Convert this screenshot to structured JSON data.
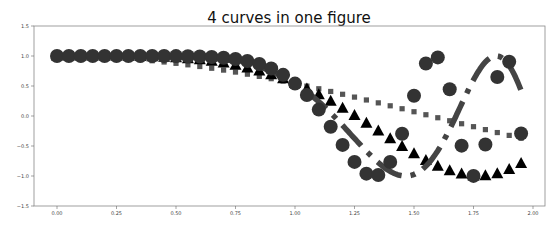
{
  "chart_data": {
    "type": "line",
    "title": "4 curves in one figure",
    "xlabel": "",
    "ylabel": "",
    "xlim": [
      -0.1,
      2.05
    ],
    "ylim": [
      -1.5,
      1.5
    ],
    "grid": false,
    "legend": null,
    "xticks": [
      "0.00",
      "0.25",
      "0.50",
      "0.75",
      "1.00",
      "1.25",
      "1.50",
      "1.75",
      "2.00"
    ],
    "xtick_values": [
      0,
      0.25,
      0.5,
      0.75,
      1.0,
      1.25,
      1.5,
      1.75,
      2.0
    ],
    "yticks": [
      "1.5",
      "1.0",
      "0.5",
      "0.0",
      "-0.5",
      "-1.0",
      "-1.5"
    ],
    "ytick_values": [
      1.5,
      1.0,
      0.5,
      0.0,
      -0.5,
      -1.0,
      -1.5
    ],
    "x": [
      0,
      0.05,
      0.1,
      0.15,
      0.2,
      0.25,
      0.3,
      0.35,
      0.4,
      0.45,
      0.5,
      0.55,
      0.6,
      0.65,
      0.7,
      0.75,
      0.8,
      0.85,
      0.9,
      0.95,
      1.0,
      1.05,
      1.1,
      1.15,
      1.2,
      1.25,
      1.3,
      1.35,
      1.4,
      1.45,
      1.5,
      1.55,
      1.6,
      1.65,
      1.7,
      1.75,
      1.8,
      1.85,
      1.9,
      1.95
    ],
    "series": [
      {
        "name": "cos(x)",
        "style": "dotted-squares",
        "color": "#555555",
        "values": [
          1,
          1,
          0.995,
          0.989,
          0.98,
          0.969,
          0.955,
          0.939,
          0.921,
          0.9,
          0.878,
          0.853,
          0.825,
          0.796,
          0.765,
          0.732,
          0.697,
          0.66,
          0.622,
          0.582,
          0.54,
          0.498,
          0.454,
          0.409,
          0.362,
          0.315,
          0.267,
          0.219,
          0.17,
          0.121,
          0.071,
          0.021,
          -0.029,
          -0.079,
          -0.129,
          -0.178,
          -0.227,
          -0.276,
          -0.323,
          -0.37
        ]
      },
      {
        "name": "cos(x^2)",
        "style": "triangles",
        "color": "#000000",
        "values": [
          1,
          1,
          1,
          1,
          0.999,
          0.998,
          0.996,
          0.993,
          0.987,
          0.98,
          0.969,
          0.955,
          0.936,
          0.912,
          0.882,
          0.846,
          0.802,
          0.75,
          0.689,
          0.62,
          0.54,
          0.451,
          0.353,
          0.246,
          0.13,
          0.008,
          -0.119,
          -0.249,
          -0.379,
          -0.507,
          -0.628,
          -0.74,
          -0.836,
          -0.913,
          -0.968,
          -0.998,
          -0.995,
          -0.962,
          -0.893,
          -0.79
        ]
      },
      {
        "name": "cos(x^3)",
        "style": "dash-dot",
        "color": "#444444",
        "values": [
          1,
          1,
          1,
          1,
          1,
          1,
          1,
          0.999,
          0.998,
          0.996,
          0.992,
          0.986,
          0.977,
          0.963,
          0.942,
          0.912,
          0.872,
          0.817,
          0.746,
          0.655,
          0.54,
          0.401,
          0.238,
          0.05,
          -0.156,
          -0.374,
          -0.586,
          -0.776,
          -0.922,
          -0.996,
          -0.974,
          -0.837,
          -0.577,
          -0.221,
          0.2,
          0.605,
          0.895,
          0.999,
          0.837,
          0.445
        ]
      },
      {
        "name": "cos(x^4)",
        "style": "circles",
        "color": "#333333",
        "values": [
          1,
          1,
          1,
          1,
          1,
          1,
          1,
          1,
          1,
          1,
          0.998,
          0.996,
          0.992,
          0.984,
          0.971,
          0.95,
          0.917,
          0.867,
          0.792,
          0.686,
          0.54,
          0.349,
          0.107,
          -0.178,
          -0.482,
          -0.765,
          -0.961,
          -0.983,
          -0.766,
          -0.297,
          0.337,
          0.874,
          0.977,
          0.445,
          -0.494,
          -0.998,
          -0.475,
          0.649,
          0.904,
          -0.292
        ]
      }
    ]
  }
}
